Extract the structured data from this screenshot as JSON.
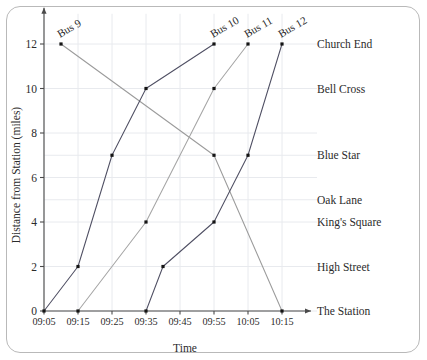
{
  "chart_data": {
    "type": "line",
    "title": "",
    "xlabel": "Time",
    "ylabel": "Distance from Station (miles)",
    "grid": true,
    "legend_position": "inline-end-of-line",
    "x_tick_labels": [
      "09:05",
      "09:15",
      "09:25",
      "09:35",
      "09:45",
      "09:55",
      "10:05",
      "10:15"
    ],
    "x_tick_minutes": [
      545,
      555,
      565,
      575,
      585,
      595,
      605,
      615
    ],
    "xlim_minutes": [
      545,
      620
    ],
    "y_tick_labels": [
      "0",
      "2",
      "4",
      "6",
      "8",
      "10",
      "12"
    ],
    "y_ticks": [
      0,
      2,
      4,
      6,
      8,
      10,
      12
    ],
    "ylim": [
      0,
      13
    ],
    "stop_labels": [
      {
        "name": "Church End",
        "miles": 12
      },
      {
        "name": "Bell Cross",
        "miles": 10
      },
      {
        "name": "Blue Star",
        "miles": 7
      },
      {
        "name": "Oak Lane",
        "miles": 5
      },
      {
        "name": "King's Square",
        "miles": 4
      },
      {
        "name": "High Street",
        "miles": 2
      },
      {
        "name": "The Station",
        "miles": 0
      }
    ],
    "series": [
      {
        "name": "Bus 9",
        "color": "#9b9b9b",
        "label_at": {
          "time": "09:10",
          "minutes": 550,
          "miles": 12
        },
        "points": [
          {
            "time": "09:10",
            "minutes": 550,
            "miles": 12
          },
          {
            "time": "09:55",
            "minutes": 595,
            "miles": 7
          },
          {
            "time": "10:15",
            "minutes": 615,
            "miles": 0
          }
        ]
      },
      {
        "name": "Bus 10",
        "color": "#4f4f63",
        "label_at": {
          "time": "09:55",
          "minutes": 595,
          "miles": 12
        },
        "points": [
          {
            "time": "09:05",
            "minutes": 545,
            "miles": 0
          },
          {
            "time": "09:15",
            "minutes": 555,
            "miles": 2
          },
          {
            "time": "09:25",
            "minutes": 565,
            "miles": 7
          },
          {
            "time": "09:35",
            "minutes": 575,
            "miles": 10
          },
          {
            "time": "09:55",
            "minutes": 595,
            "miles": 12
          }
        ]
      },
      {
        "name": "Bus 11",
        "color": "#a5a5a5",
        "label_at": {
          "time": "10:05",
          "minutes": 605,
          "miles": 12
        },
        "points": [
          {
            "time": "09:15",
            "minutes": 555,
            "miles": 0
          },
          {
            "time": "09:35",
            "minutes": 575,
            "miles": 4
          },
          {
            "time": "09:55",
            "minutes": 595,
            "miles": 10
          },
          {
            "time": "10:05",
            "minutes": 605,
            "miles": 12
          }
        ]
      },
      {
        "name": "Bus 12",
        "color": "#4f4f63",
        "label_at": {
          "time": "10:15",
          "minutes": 615,
          "miles": 12
        },
        "points": [
          {
            "time": "09:35",
            "minutes": 575,
            "miles": 0
          },
          {
            "time": "09:40",
            "minutes": 580,
            "miles": 2
          },
          {
            "time": "09:55",
            "minutes": 595,
            "miles": 4
          },
          {
            "time": "10:05",
            "minutes": 605,
            "miles": 7
          },
          {
            "time": "10:15",
            "minutes": 615,
            "miles": 12
          }
        ]
      }
    ]
  },
  "colors": {
    "grid": "#e8eaee",
    "axis": "#4a4a4a",
    "text": "#2b2b2b",
    "frame": "#b9b9b9",
    "background": "#ffffff"
  }
}
